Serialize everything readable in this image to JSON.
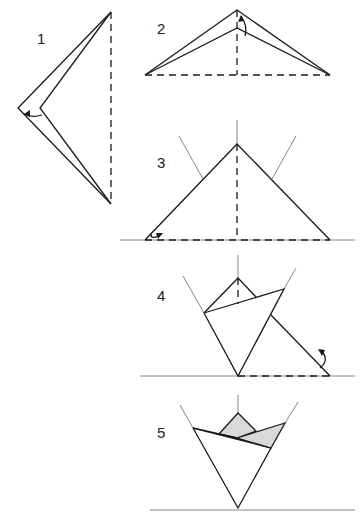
{
  "steps": [
    {
      "number": "1",
      "instruction": "valley fold along dashed line, fold flap inward"
    },
    {
      "number": "2",
      "instruction": "fold top layer down along vertical dashed line"
    },
    {
      "number": "3",
      "instruction": "fold bottom-left corner up"
    },
    {
      "number": "4",
      "instruction": "fold bottom-right flap behind"
    },
    {
      "number": "5",
      "instruction": "finished shape"
    }
  ],
  "colors": {
    "line": "#1a1a1a",
    "guide": "#888888",
    "shade": "#d9d9d9",
    "background": "#ffffff"
  }
}
